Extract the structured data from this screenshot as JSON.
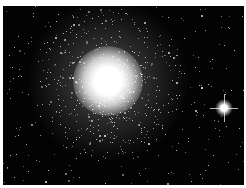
{
  "image": {
    "subject": "globular star cluster",
    "alt": "Globular star cluster with dense bright core and scattered stars on a black sky",
    "background_color": "#030303",
    "border_color": "#ffffff",
    "cluster_center": [
      108,
      85
    ],
    "bright_star": [
      225,
      108
    ]
  }
}
